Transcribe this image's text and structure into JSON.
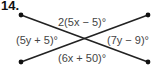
{
  "problem_number": "14.",
  "diagram": {
    "angles": {
      "top": "2(5x − 5)°",
      "left": "(5y + 5)°",
      "right": "(7y − 9)°",
      "bottom": "(6x + 50)°"
    },
    "line_color": "#222222"
  }
}
